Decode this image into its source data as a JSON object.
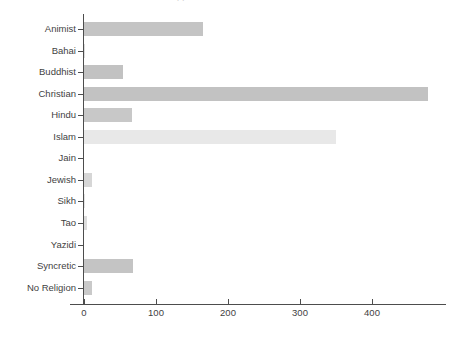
{
  "chart_data": {
    "type": "bar",
    "orientation": "horizontal",
    "title": "",
    "xlabel": "",
    "ylabel": "",
    "xlim": [
      0,
      487
    ],
    "xticks": [
      0,
      100,
      200,
      300,
      400
    ],
    "grid": false,
    "legend": "none",
    "categories": [
      "Animist",
      "Bahai",
      "Buddhist",
      "Christian",
      "Hindu",
      "Islam",
      "Jain",
      "Jewish",
      "Sikh",
      "Tao",
      "Yazidi",
      "Syncretic",
      "No Religion"
    ],
    "values": [
      165,
      1,
      54,
      478,
      66,
      350,
      0,
      11,
      1,
      4,
      0,
      68,
      11
    ],
    "bar_colors": [
      "#c4c4c4",
      "#dcdcdc",
      "#c2c2c2",
      "#c2c2c2",
      "#c8c8c8",
      "#e8e8e8",
      "#efefef",
      "#d6d6d6",
      "#e4e4e4",
      "#dcdcdc",
      "#efefef",
      "#c4c4c4",
      "#c9c9c9"
    ]
  },
  "axes": {
    "x_tick_labels": [
      "0",
      "100",
      "200",
      "300",
      "400"
    ],
    "axis_color": "#4d4d4d",
    "tick_label_color": "#3f3f3f"
  },
  "header": {
    "clipped_title": "clipped header text"
  }
}
